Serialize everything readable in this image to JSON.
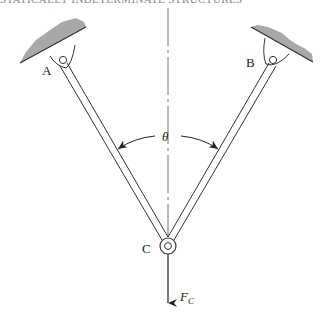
{
  "header": {
    "text": "STATICALLY INDETERMINATE STRUCTURES"
  },
  "diagram": {
    "type": "two-bar pin-jointed truss",
    "colors": {
      "line": "#333333",
      "ground_fill": "#a8a8a8",
      "centerline": "#777777"
    },
    "supports": [
      {
        "id": "A",
        "label": "A",
        "pin": [
          63,
          60
        ],
        "ground": [
          [
            20,
            63
          ],
          [
            86,
            27
          ]
        ],
        "label_pos": [
          42,
          75
        ]
      },
      {
        "id": "B",
        "label": "B",
        "pin": [
          273,
          60
        ],
        "ground": [
          [
            251,
            27
          ],
          [
            313,
            62
          ]
        ],
        "label_pos": [
          246,
          67
        ]
      }
    ],
    "joint": {
      "id": "C",
      "label": "C",
      "center": [
        168,
        246
      ],
      "label_pos": [
        142,
        253
      ]
    },
    "members": [
      {
        "from": "A",
        "to": "C"
      },
      {
        "from": "B",
        "to": "C"
      }
    ],
    "angle": {
      "symbol": "θ",
      "label_pos": [
        162,
        141
      ]
    },
    "force": {
      "symbol": "F",
      "subscript": "C",
      "direction": "down",
      "label_pos": [
        180,
        301
      ]
    },
    "centerline": {
      "x": 168,
      "style": "dash-dot"
    }
  }
}
